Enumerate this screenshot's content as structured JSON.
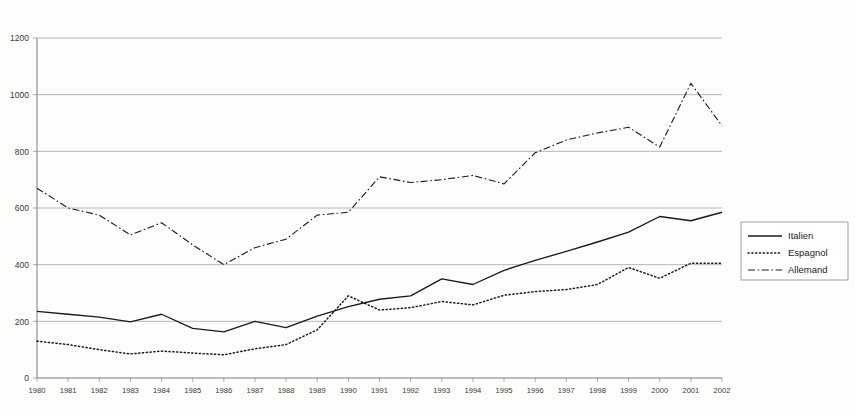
{
  "chart_data": {
    "type": "line",
    "title": "",
    "subtitle": "",
    "xlabel": "",
    "ylabel": "",
    "categories": [
      1980,
      1981,
      1982,
      1983,
      1984,
      1985,
      1986,
      1987,
      1988,
      1989,
      1990,
      1991,
      1992,
      1993,
      1994,
      1995,
      1996,
      1997,
      1998,
      1999,
      2000,
      2001,
      2002
    ],
    "xlim": [
      1980,
      2002
    ],
    "ylim": [
      0,
      1200
    ],
    "yticks": [
      0,
      200,
      400,
      600,
      800,
      1000,
      1200
    ],
    "ytick_labels": [
      "0",
      "200",
      "400",
      "600",
      "800",
      "1000",
      "1200"
    ],
    "xtick_labels": [
      "1980",
      "1981",
      "1982",
      "1983",
      "1984",
      "1985",
      "1986",
      "1987",
      "1988",
      "1989",
      "1990",
      "1991",
      "1992",
      "1993",
      "1994",
      "1995",
      "1996",
      "1997",
      "1998",
      "1999",
      "2000",
      "2001",
      "2002"
    ],
    "grid": true,
    "grid_axis": "y",
    "legend_position": "right",
    "series": [
      {
        "name": "Italien",
        "style": "solid",
        "color": "#1a1a1a",
        "values": [
          235,
          225,
          215,
          198,
          225,
          175,
          163,
          200,
          178,
          218,
          252,
          278,
          290,
          350,
          330,
          380,
          415,
          447,
          480,
          515,
          570,
          555,
          585
        ]
      },
      {
        "name": "Espagnol",
        "style": "dotted",
        "color": "#1a1a1a",
        "values": [
          130,
          118,
          100,
          85,
          95,
          88,
          82,
          103,
          118,
          170,
          290,
          240,
          248,
          270,
          258,
          292,
          305,
          312,
          330,
          390,
          352,
          405,
          405
        ]
      },
      {
        "name": "Allemand",
        "style": "dashdot",
        "color": "#1a1a1a",
        "values": [
          670,
          600,
          575,
          505,
          548,
          470,
          400,
          460,
          490,
          575,
          585,
          710,
          690,
          700,
          715,
          685,
          795,
          840,
          865,
          885,
          815,
          1040,
          890
        ]
      }
    ]
  },
  "legend": {
    "items": [
      {
        "label": "Italien",
        "style": "solid"
      },
      {
        "label": "Espagnol",
        "style": "dotted"
      },
      {
        "label": "Allemand",
        "style": "dashdot"
      }
    ]
  },
  "colors": {
    "background": "#fdfdfc",
    "grid": "#9a9a9a",
    "axis": "#6d6d6d",
    "line": "#1a1a1a",
    "text": "#3a3a3a",
    "legend_border": "#8a8a8a"
  }
}
